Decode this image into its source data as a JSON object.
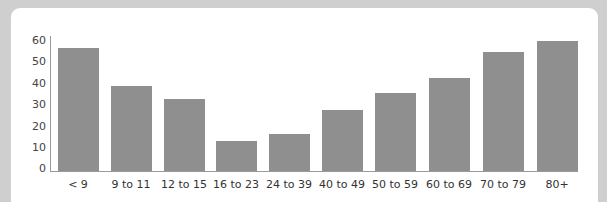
{
  "chart_data": {
    "type": "bar",
    "title": "",
    "xlabel": "",
    "ylabel": "",
    "categories": [
      "< 9",
      "9 to 11",
      "12 to 15",
      "16 to 23",
      "24 to 39",
      "40 to 49",
      "50 to 59",
      "60 to 69",
      "70 to 79",
      "80+"
    ],
    "values": [
      57,
      39,
      33,
      14,
      17,
      28,
      36,
      43,
      55,
      60
    ],
    "ylim": [
      0,
      60
    ],
    "yticks": [
      "0",
      "10",
      "20",
      "30",
      "40",
      "50",
      "60"
    ],
    "grid": false,
    "legend": null,
    "bar_color": "#8f8f8f"
  }
}
